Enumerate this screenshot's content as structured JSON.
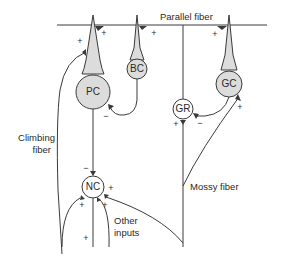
{
  "diagram": {
    "colors": {
      "line": "#3a3a3a",
      "shaded_fill": "#dcdcdc",
      "unshaded_fill": "#ffffff",
      "text": "#2a2a2a"
    },
    "labels": {
      "parallel_fiber": "Parallel fiber",
      "climbing_fiber_line1": "Climbing",
      "climbing_fiber_line2": "fiber",
      "mossy_fiber": "Mossy fiber",
      "other_inputs_line1": "Other",
      "other_inputs_line2": "inputs"
    },
    "cells": {
      "pc": {
        "label": "PC",
        "name": "Purkinje cell",
        "shaded": true
      },
      "bc": {
        "label": "BC",
        "name": "Basket cell",
        "shaded": true
      },
      "gc": {
        "label": "GC",
        "name": "Golgi cell",
        "shaded": true
      },
      "gr": {
        "label": "GR",
        "name": "Granule cell",
        "shaded": false
      },
      "nc": {
        "label": "NC",
        "name": "Nuclear cell",
        "shaded": false
      }
    },
    "signs": {
      "pf_to_pc": "+",
      "cf_to_pc": "+",
      "pf_to_bc": "+",
      "pf_to_gc": "+",
      "bc_to_pc": "−",
      "gc_to_gr": "−",
      "mf_to_gr": "+",
      "mf_to_gc": "+",
      "pc_to_nc": "−",
      "cf_to_nc": "+",
      "mf_to_nc": "+",
      "other_to_nc": "+",
      "input_bottom": "+"
    }
  }
}
